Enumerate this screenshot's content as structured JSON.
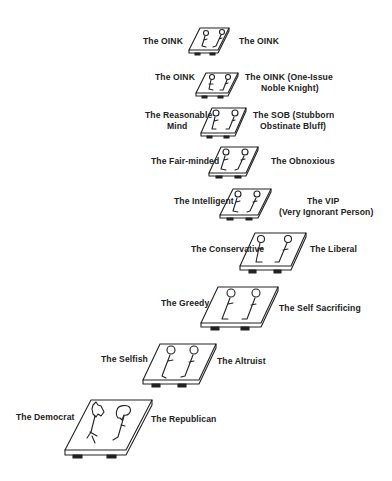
{
  "diagram": {
    "title": "",
    "stages": [
      {
        "left": "The OINK",
        "right": "The OINK",
        "figures": "stick"
      },
      {
        "left": "The OINK",
        "right_line1": "The OINK (One-Issue",
        "right_line2": "Noble Knight)",
        "figures": "stick"
      },
      {
        "left_line1": "The Reasonable",
        "left_line2": "Mind",
        "right_line1": "The SOB (Stubborn",
        "right_line2": "Obstinate Bluff)",
        "figures": "stick"
      },
      {
        "left": "The Fair-minded",
        "right": "The Obnoxious",
        "figures": "stick"
      },
      {
        "left": "The Intelligent",
        "right_line1": "The VIP",
        "right_line2": "(Very Ignorant Person)",
        "figures": "stick"
      },
      {
        "left": "The Conservative",
        "right": "The Liberal",
        "figures": "stick"
      },
      {
        "left": "The Greedy",
        "right": "The Self Sacrificing",
        "figures": "stick"
      },
      {
        "left": "The Selfish",
        "right": "The Altruist",
        "figures": "stick"
      },
      {
        "left": "The Democrat",
        "right": "The Republican",
        "figures": "donkey-elephant"
      }
    ]
  }
}
